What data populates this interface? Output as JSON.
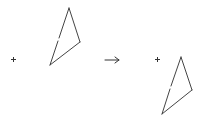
{
  "diagram": {
    "type": "transformation",
    "stroke_color": "#444444",
    "left_figure": {
      "center_marker": "+",
      "center": [
        13,
        59
      ],
      "vertices": [
        [
          69,
          8
        ],
        [
          80,
          42
        ],
        [
          50,
          65
        ]
      ],
      "left_edge_gap": [
        [
          58,
          41
        ],
        [
          59,
          38
        ]
      ]
    },
    "operator": {
      "symbol": "→",
      "name": "arrow-right"
    },
    "right_figure": {
      "center_marker": "+",
      "center": [
        157,
        59
      ],
      "vertices": [
        [
          181,
          57
        ],
        [
          192,
          90
        ],
        [
          162,
          114
        ]
      ],
      "left_edge_gap": [
        [
          170,
          89
        ],
        [
          171,
          86
        ]
      ]
    }
  }
}
